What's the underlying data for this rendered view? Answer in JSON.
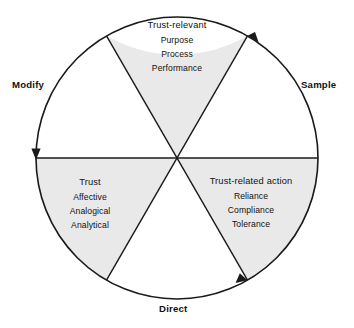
{
  "diagram": {
    "shape": "circle-six-wedges",
    "colors": {
      "shaded_wedge": "#e9e9e9",
      "plain_wedge": "#ffffff",
      "stroke": "#1a1a1a",
      "text": "#111111",
      "background": "#ffffff"
    },
    "geometry": {
      "center_x": 177,
      "center_y": 158,
      "radius": 141,
      "wedge_count": 6,
      "wedge_span_degrees": 60
    }
  },
  "wedges": [
    {
      "name": "trust-relevant",
      "shaded": true,
      "heading": "Trust-relevant",
      "items": [
        "Purpose",
        "Process",
        "Performance"
      ]
    },
    {
      "name": "trust-related-action",
      "shaded": true,
      "heading": "Trust-related action",
      "items": [
        "Reliance",
        "Compliance",
        "Tolerance"
      ]
    },
    {
      "name": "trust",
      "shaded": true,
      "heading": "Trust",
      "items": [
        "Affective",
        "Analogical",
        "Analytical"
      ]
    }
  ],
  "arc_labels": {
    "modify": "Modify",
    "sample": "Sample",
    "direct": "Direct"
  }
}
